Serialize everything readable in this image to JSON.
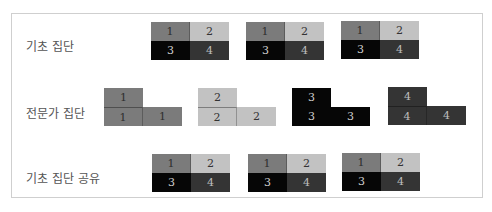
{
  "rows": [
    {
      "label": "기초 집단"
    },
    {
      "label": "전문가 집단"
    },
    {
      "label": "기초 집단 공유"
    }
  ],
  "basic_blocks": [
    {
      "cells": [
        "1",
        "2",
        "3",
        "4"
      ]
    },
    {
      "cells": [
        "1",
        "2",
        "3",
        "4"
      ]
    },
    {
      "cells": [
        "1",
        "2",
        "3",
        "4"
      ]
    }
  ],
  "expert_blocks": [
    {
      "cells": [
        "1",
        "1",
        "1"
      ],
      "color": "#7b7b7b"
    },
    {
      "cells": [
        "2",
        "2",
        "2"
      ],
      "color": "#c2c2c2"
    },
    {
      "cells": [
        "3",
        "3",
        "3"
      ],
      "color": "#060606"
    },
    {
      "cells": [
        "4",
        "4",
        "4"
      ],
      "color": "#343434"
    }
  ],
  "shared_blocks": [
    {
      "cells": [
        "1",
        "2",
        "3",
        "4"
      ]
    },
    {
      "cells": [
        "1",
        "2",
        "3",
        "4"
      ]
    },
    {
      "cells": [
        "1",
        "2",
        "3",
        "4"
      ]
    }
  ],
  "colors": {
    "member_1": "#7b7b7b",
    "member_2": "#c2c2c2",
    "member_3": "#060606",
    "member_4": "#343434"
  }
}
